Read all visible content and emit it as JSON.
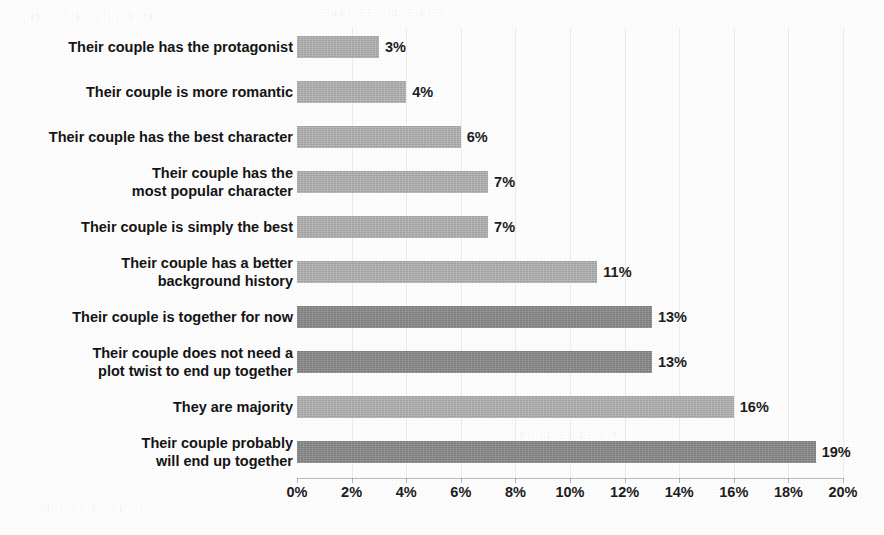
{
  "chart_data": {
    "type": "bar",
    "orientation": "horizontal",
    "title": "",
    "xlabel": "",
    "ylabel": "",
    "xlim": [
      0,
      20
    ],
    "xtick_labels": [
      "0%",
      "2%",
      "4%",
      "6%",
      "8%",
      "10%",
      "12%",
      "14%",
      "16%",
      "18%",
      "20%"
    ],
    "xtick_values": [
      0,
      2,
      4,
      6,
      8,
      10,
      12,
      14,
      16,
      18,
      20
    ],
    "grid": "vertical-faint",
    "legend": "none",
    "categories": [
      "Their couple has the protagonist",
      "Their couple is more romantic",
      "Their couple has the best character",
      "Their couple has the\nmost popular character",
      "Their couple is simply the best",
      "Their couple has a better\nbackground history",
      "Their couple is together for now",
      "Their couple does not need a\nplot twist to end up together",
      "They are majority",
      "Their couple probably\nwill end up together"
    ],
    "values": [
      3,
      4,
      6,
      7,
      7,
      11,
      13,
      13,
      16,
      19
    ],
    "value_labels": [
      "3%",
      "4%",
      "6%",
      "7%",
      "7%",
      "11%",
      "13%",
      "13%",
      "16%",
      "19%"
    ],
    "bar_shades": [
      "light",
      "light",
      "light",
      "light",
      "light",
      "light",
      "dark",
      "dark",
      "light",
      "dark"
    ],
    "colors": {
      "bar_light": "#b0b0b0",
      "bar_dark": "#878787",
      "text": "#141414",
      "axis": "#6e6e78",
      "background": "#fdfdfd"
    }
  },
  "background_ghost_text": [
    "ıı ·  ː  ıː  ·ː ·  ıːːı",
    "·  ııː  ·ː· ːı  · ıː·ː",
    "ːı · ːː ı  ·ːı ·ː",
    "ıː ·ı  ː· ıː  · ı"
  ]
}
